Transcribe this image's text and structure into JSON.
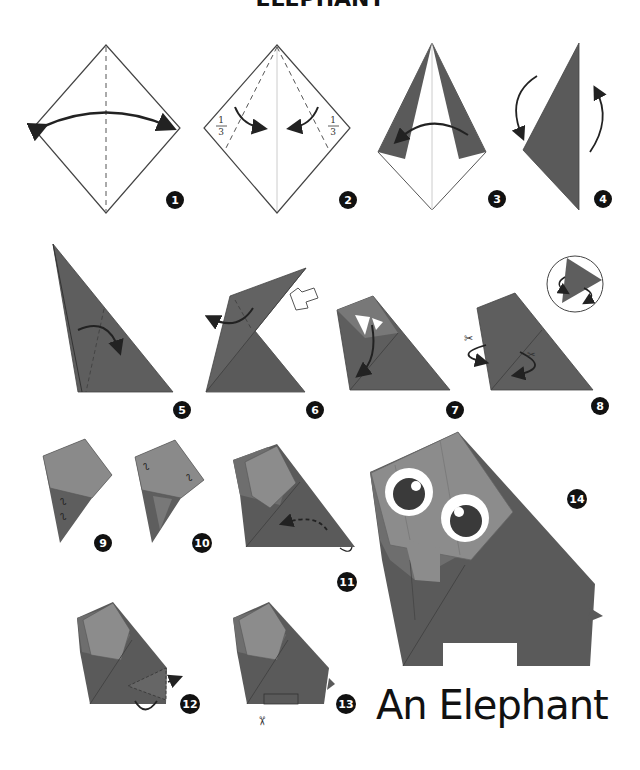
{
  "header": {
    "title_cropped": "ELEPHANT"
  },
  "title": "An Elephant",
  "colors": {
    "dark_paper": "#5a5a5a",
    "mid_paper": "#6e6e6e",
    "light_paper": "#8c8c8c",
    "line": "#333333",
    "badge": "#111111"
  },
  "steps": [
    {
      "number": "1"
    },
    {
      "number": "2"
    },
    {
      "number": "3"
    },
    {
      "number": "4"
    },
    {
      "number": "5"
    },
    {
      "number": "6"
    },
    {
      "number": "7"
    },
    {
      "number": "8"
    },
    {
      "number": "9"
    },
    {
      "number": "10"
    },
    {
      "number": "11"
    },
    {
      "number": "12"
    },
    {
      "number": "13"
    },
    {
      "number": "14"
    }
  ],
  "fraction": {
    "num": "1",
    "den": "3"
  },
  "icons": [
    "fold-arrow-icon",
    "scissors-icon",
    "push-arrow-icon",
    "pleat-icon"
  ]
}
